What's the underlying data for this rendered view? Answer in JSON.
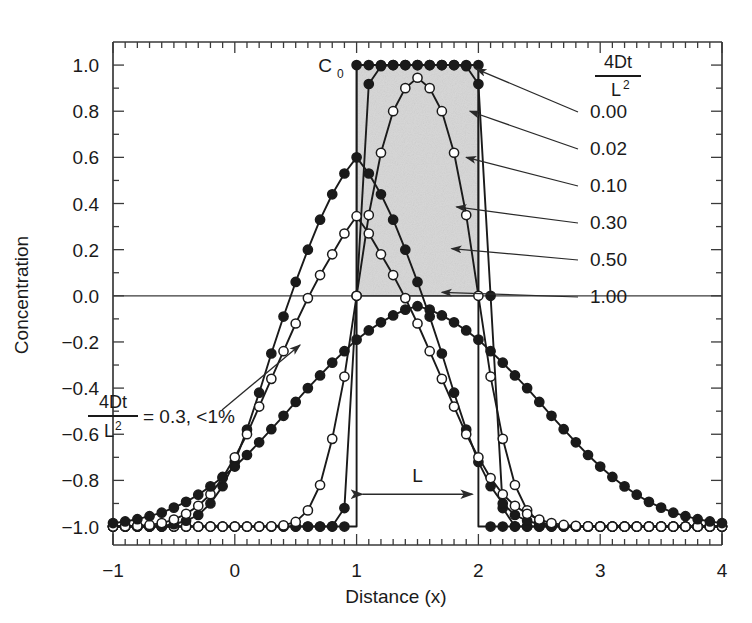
{
  "figure": {
    "background": "#ffffff",
    "plot_frame_color": "#3a3a3a",
    "shade_color": "#d6d6d6",
    "curve_color": "#1a1a1a",
    "marker_filled_color": "#1a1a1a",
    "marker_open_color": "#ffffff"
  },
  "axes": {
    "xlabel": "Distance (x)",
    "ylabel": "Concentration",
    "x_ticks": [
      "-1",
      "0",
      "1",
      "2",
      "3",
      "4"
    ],
    "x_tick_values": [
      -1,
      0,
      1,
      2,
      3,
      4
    ],
    "y_ticks": [
      "1.0",
      "0.8",
      "0.6",
      "0.4",
      "0.2",
      "0.0",
      "-0.2",
      "-0.4",
      "-0.6",
      "-0.8",
      "-1.0"
    ],
    "y_tick_values": [
      1.0,
      0.8,
      0.6,
      0.4,
      0.2,
      0.0,
      -0.2,
      -0.4,
      -0.6,
      -0.8,
      -1.0
    ],
    "xlim": [
      -1,
      4
    ],
    "ylim": [
      -1.08,
      1.1
    ],
    "x_minor_step": 0.1,
    "y_minor_step": 0.1,
    "grid": false
  },
  "annotations": {
    "c0_label": "C",
    "c0_sub": "0",
    "span_label": "L",
    "note_num": "4Dt",
    "note_den": "L",
    "note_den_sup": "2",
    "note_rest": "= 0.3, <1%",
    "legend_title_num": "4Dt",
    "legend_title_den": "L",
    "legend_title_den_sup": "2"
  },
  "legend": {
    "position": "right",
    "entries": [
      "0.00",
      "0.02",
      "0.10",
      "0.30",
      "0.50",
      "1.00"
    ]
  },
  "chart_data": {
    "type": "line",
    "title": "",
    "xlabel": "Distance (x)",
    "ylabel": "Concentration",
    "xlim": [
      -1,
      4
    ],
    "ylim": [
      -1.08,
      1.1
    ],
    "grid": false,
    "legend_title": "4Dt/L^2",
    "legend_position": "right",
    "shaded_region": {
      "x0": 1.0,
      "x1": 2.0,
      "y0": 0.0,
      "y1": 1.0,
      "label": "C0"
    },
    "span_marker": {
      "from": 1.0,
      "to": 2.0,
      "y": -0.86,
      "label": "L"
    },
    "annotation_note": "4Dt/L^2 = 0.3, <1%",
    "x": [
      -1.0,
      -0.9,
      -0.8,
      -0.7,
      -0.6,
      -0.5,
      -0.4,
      -0.3,
      -0.2,
      -0.1,
      0.0,
      0.1,
      0.2,
      0.3,
      0.4,
      0.5,
      0.6,
      0.7,
      0.8,
      0.9,
      1.0,
      1.1,
      1.2,
      1.3,
      1.4,
      1.5,
      1.6,
      1.7,
      1.8,
      1.9,
      2.0,
      2.1,
      2.2,
      2.3,
      2.4,
      2.5,
      2.6,
      2.7,
      2.8,
      2.9,
      3.0,
      3.1,
      3.2,
      3.3,
      3.4,
      3.5,
      3.6,
      3.7,
      3.8,
      3.9,
      4.0
    ],
    "series": [
      {
        "name": "0.00",
        "marker": "filled",
        "label_value": 0.0,
        "values": [
          -1.0,
          -1.0,
          -1.0,
          -1.0,
          -1.0,
          -1.0,
          -1.0,
          -1.0,
          -1.0,
          -1.0,
          -1.0,
          -1.0,
          -1.0,
          -1.0,
          -1.0,
          -1.0,
          -1.0,
          -1.0,
          -1.0,
          -1.0,
          1.0,
          1.0,
          1.0,
          1.0,
          1.0,
          1.0,
          1.0,
          1.0,
          1.0,
          1.0,
          1.0,
          -1.0,
          -1.0,
          -1.0,
          -1.0,
          -1.0,
          -1.0,
          -1.0,
          -1.0,
          -1.0,
          -1.0,
          -1.0,
          -1.0,
          -1.0,
          -1.0,
          -1.0,
          -1.0,
          -1.0,
          -1.0,
          -1.0,
          -1.0
        ]
      },
      {
        "name": "0.02",
        "marker": "filled",
        "label_value": 0.02,
        "values": [
          -1.0,
          -1.0,
          -1.0,
          -1.0,
          -1.0,
          -1.0,
          -1.0,
          -1.0,
          -1.0,
          -1.0,
          -1.0,
          -1.0,
          -1.0,
          -1.0,
          -1.0,
          -1.0,
          -1.0,
          -1.0,
          -0.999,
          -0.92,
          0.0,
          0.918,
          0.995,
          1.0,
          1.0,
          1.0,
          1.0,
          1.0,
          1.0,
          0.995,
          0.918,
          0.0,
          -0.92,
          -0.999,
          -1.0,
          -1.0,
          -1.0,
          -1.0,
          -1.0,
          -1.0,
          -1.0,
          -1.0,
          -1.0,
          -1.0,
          -1.0,
          -1.0,
          -1.0,
          -1.0,
          -1.0,
          -1.0,
          -1.0
        ]
      },
      {
        "name": "0.10",
        "marker": "open",
        "label_value": 0.1,
        "values": [
          -1.0,
          -1.0,
          -1.0,
          -1.0,
          -1.0,
          -1.0,
          -1.0,
          -1.0,
          -1.0,
          -1.0,
          -1.0,
          -1.0,
          -1.0,
          -0.999,
          -0.995,
          -0.98,
          -0.93,
          -0.82,
          -0.62,
          -0.35,
          0.0,
          0.35,
          0.62,
          0.8,
          0.9,
          0.945,
          0.9,
          0.8,
          0.62,
          0.35,
          0.0,
          -0.35,
          -0.62,
          -0.82,
          -0.93,
          -0.98,
          -0.995,
          -0.999,
          -1.0,
          -1.0,
          -1.0,
          -1.0,
          -1.0,
          -1.0,
          -1.0,
          -1.0,
          -1.0,
          -1.0,
          -1.0,
          -1.0,
          -1.0
        ]
      },
      {
        "name": "0.30",
        "marker": "filled",
        "label_value": 0.3,
        "values": [
          -1.0,
          -1.0,
          -1.0,
          -0.999,
          -0.997,
          -0.99,
          -0.975,
          -0.95,
          -0.9,
          -0.825,
          -0.72,
          -0.58,
          -0.42,
          -0.25,
          -0.09,
          0.06,
          0.2,
          0.33,
          0.44,
          0.53,
          0.6,
          0.53,
          0.44,
          0.33,
          0.2,
          0.06,
          -0.09,
          -0.25,
          -0.42,
          -0.58,
          -0.72,
          -0.825,
          -0.9,
          -0.95,
          -0.975,
          -0.99,
          -0.997,
          -0.999,
          -1.0,
          -1.0,
          -1.0,
          -1.0,
          -1.0,
          -1.0,
          -1.0,
          -1.0,
          -1.0,
          -1.0,
          -1.0,
          -1.0,
          -1.0
        ]
      },
      {
        "name": "0.50",
        "marker": "open",
        "label_value": 0.5,
        "values": [
          -1.0,
          -0.999,
          -0.997,
          -0.993,
          -0.985,
          -0.97,
          -0.945,
          -0.91,
          -0.86,
          -0.79,
          -0.7,
          -0.6,
          -0.48,
          -0.36,
          -0.24,
          -0.12,
          -0.01,
          0.09,
          0.18,
          0.27,
          0.345,
          0.27,
          0.18,
          0.09,
          -0.01,
          -0.12,
          -0.24,
          -0.36,
          -0.48,
          -0.6,
          -0.7,
          -0.79,
          -0.86,
          -0.91,
          -0.945,
          -0.97,
          -0.985,
          -0.993,
          -0.997,
          -0.999,
          -1.0,
          -1.0,
          -1.0,
          -1.0,
          -1.0,
          -1.0,
          -1.0,
          -1.0,
          -1.0,
          -1.0,
          -1.0
        ]
      },
      {
        "name": "1.00",
        "marker": "filled",
        "label_value": 1.0,
        "values": [
          -0.985,
          -0.978,
          -0.968,
          -0.955,
          -0.94,
          -0.918,
          -0.893,
          -0.862,
          -0.826,
          -0.785,
          -0.74,
          -0.69,
          -0.635,
          -0.578,
          -0.52,
          -0.46,
          -0.4,
          -0.345,
          -0.29,
          -0.24,
          -0.19,
          -0.15,
          -0.115,
          -0.085,
          -0.06,
          -0.045,
          -0.06,
          -0.085,
          -0.115,
          -0.15,
          -0.19,
          -0.24,
          -0.29,
          -0.345,
          -0.4,
          -0.46,
          -0.52,
          -0.578,
          -0.635,
          -0.69,
          -0.74,
          -0.785,
          -0.826,
          -0.862,
          -0.893,
          -0.918,
          -0.94,
          -0.955,
          -0.968,
          -0.978,
          -0.985
        ]
      }
    ]
  }
}
